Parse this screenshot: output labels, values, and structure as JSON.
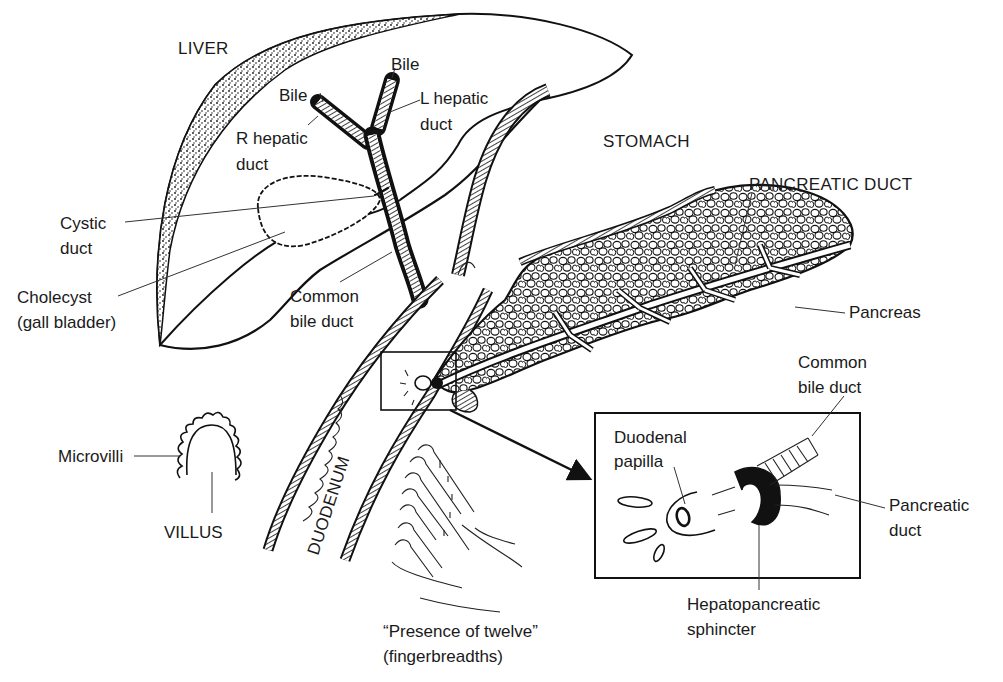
{
  "figure": {
    "type": "anatomical line drawing",
    "colors": {
      "ink": "#111111",
      "background": "#ffffff"
    }
  },
  "labels": {
    "liver": "LIVER",
    "bile_left": "Bile",
    "bile_right": "Bile",
    "l_hepatic_duct": [
      "L hepatic",
      "duct"
    ],
    "r_hepatic_duct": [
      "R hepatic",
      "duct"
    ],
    "stomach": "STOMACH",
    "pancreatic_duct_main": "PANCREATIC DUCT",
    "cystic_duct": [
      "Cystic",
      "duct"
    ],
    "cholecyst": [
      "Cholecyst",
      "(gall bladder)"
    ],
    "common_bile_duct_main": [
      "Common",
      "bile duct"
    ],
    "pancreas": "Pancreas",
    "microvilli": "Microvilli",
    "villus": "VILLUS",
    "duodenum": "DUODENUM",
    "presence_of_twelve": [
      "“Presence of twelve”",
      "(fingerbreadths)"
    ],
    "inset_common_bile_duct": [
      "Common",
      "bile duct"
    ],
    "duodenal_papilla": [
      "Duodenal",
      "papilla"
    ],
    "inset_pancreatic_duct": [
      "Pancreatic",
      "duct"
    ],
    "hepatopancreatic_sphincter": [
      "Hepatopancreatic",
      "sphincter"
    ]
  }
}
